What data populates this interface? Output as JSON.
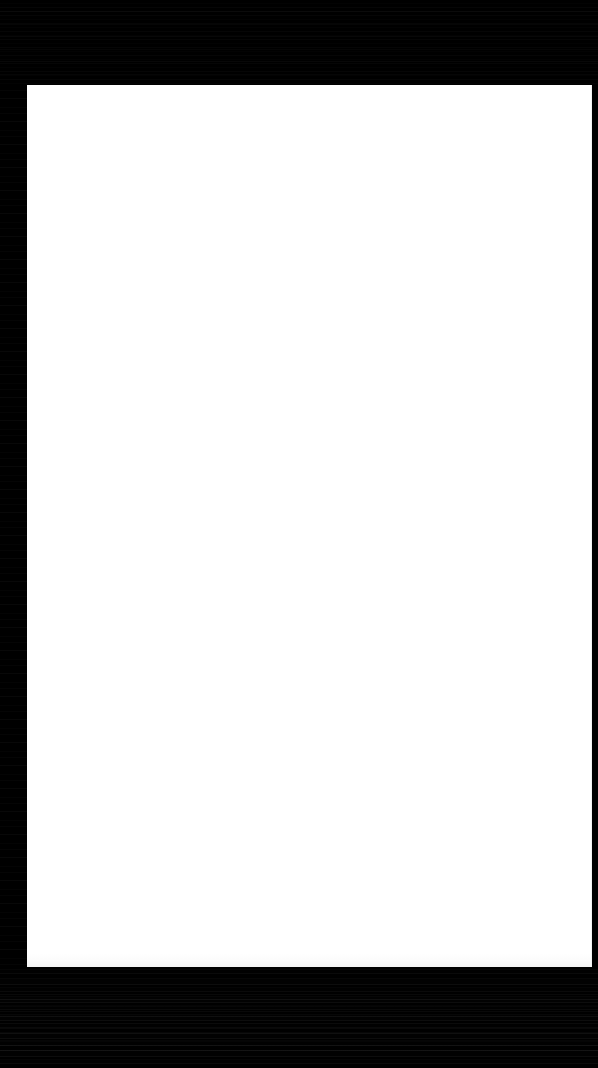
{
  "window": {
    "title": "",
    "width": 598,
    "height": 1068
  },
  "chrome": {
    "top_bar": {
      "label": "",
      "color": "#000000",
      "height": 85
    },
    "left_gutter": {
      "label": "",
      "color": "#000000",
      "width": 27
    },
    "right_edge": {
      "label": "",
      "color": "#000000",
      "width": 6
    },
    "bottom_bar": {
      "label": "",
      "color": "#000000",
      "height": 101
    }
  },
  "content": {
    "page": {
      "label": "",
      "background_color": "#ffffff",
      "border_color": "#f1f1f1",
      "x": 27,
      "y": 85,
      "width": 565,
      "height": 882
    },
    "body_text": "",
    "empty_state_text": ""
  }
}
